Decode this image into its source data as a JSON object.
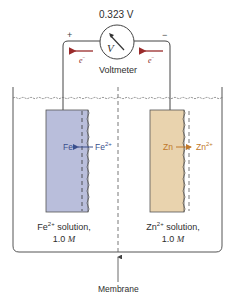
{
  "voltmeter": {
    "reading": "0.323 V",
    "label": "Voltmeter",
    "symbol": "V",
    "positive_terminal": "+",
    "negative_terminal": "−"
  },
  "electrons": {
    "left_label": "e",
    "left_sup": "−",
    "right_label": "e",
    "right_sup": "−",
    "color": "#9a2a2a"
  },
  "left_cell": {
    "electrode_color": "#b9bedb",
    "metal": "Fe",
    "ion": "Fe",
    "ion_charge": "2+",
    "ion_color": "#3a4f8c",
    "solution_ion": "Fe",
    "solution_charge": "2+",
    "solution_text": " solution,",
    "concentration_value": "1.0 ",
    "concentration_unit": "M"
  },
  "right_cell": {
    "electrode_color": "#e9d3ae",
    "metal": "Zn",
    "ion": "Zn",
    "ion_charge": "2+",
    "ion_color": "#c0782a",
    "solution_ion": "Zn",
    "solution_charge": "2+",
    "solution_text": " solution,",
    "concentration_value": "1.0 ",
    "concentration_unit": "M"
  },
  "membrane": {
    "label": "Membrane"
  }
}
